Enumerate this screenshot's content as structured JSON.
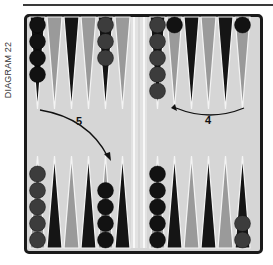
{
  "diagram": {
    "label": "DIAGRAM 22",
    "colors": {
      "board": "#d6d6d6",
      "frame": "#1a1a1a",
      "point_dark": "#151515",
      "point_light": "#9a9a9a",
      "checker_black": "#121212",
      "checker_gray": "#3c3c3c",
      "bar": "#e2e2e2"
    },
    "moves": [
      {
        "id": "move-5",
        "label": "5",
        "description": "Arrow from top-left point area curving down to bottom-left point with 4 black checkers"
      },
      {
        "id": "move-4",
        "label": "4",
        "description": "Arrow curving leftward across top-right quadrant"
      }
    ],
    "top_points": [
      {
        "quadrant": "top-left",
        "index": 1,
        "color": "dark",
        "checkers": 4,
        "checker_color": "black"
      },
      {
        "quadrant": "top-left",
        "index": 2,
        "color": "light",
        "checkers": 0
      },
      {
        "quadrant": "top-left",
        "index": 3,
        "color": "dark",
        "checkers": 0
      },
      {
        "quadrant": "top-left",
        "index": 4,
        "color": "light",
        "checkers": 0
      },
      {
        "quadrant": "top-left",
        "index": 5,
        "color": "dark",
        "checkers": 3,
        "checker_color": "gray"
      },
      {
        "quadrant": "top-left",
        "index": 6,
        "color": "light",
        "checkers": 0
      },
      {
        "quadrant": "top-right",
        "index": 7,
        "color": "dark",
        "checkers": 5,
        "checker_color": "gray"
      },
      {
        "quadrant": "top-right",
        "index": 8,
        "color": "light",
        "checkers": 1,
        "checker_color": "black"
      },
      {
        "quadrant": "top-right",
        "index": 9,
        "color": "dark",
        "checkers": 0
      },
      {
        "quadrant": "top-right",
        "index": 10,
        "color": "light",
        "checkers": 0
      },
      {
        "quadrant": "top-right",
        "index": 11,
        "color": "dark",
        "checkers": 0
      },
      {
        "quadrant": "top-right",
        "index": 12,
        "color": "light",
        "checkers": 1,
        "checker_color": "black"
      }
    ],
    "bottom_points": [
      {
        "quadrant": "bottom-left",
        "index": 1,
        "color": "light",
        "checkers": 5,
        "checker_color": "gray"
      },
      {
        "quadrant": "bottom-left",
        "index": 2,
        "color": "dark",
        "checkers": 0
      },
      {
        "quadrant": "bottom-left",
        "index": 3,
        "color": "light",
        "checkers": 0
      },
      {
        "quadrant": "bottom-left",
        "index": 4,
        "color": "dark",
        "checkers": 0
      },
      {
        "quadrant": "bottom-left",
        "index": 5,
        "color": "light",
        "checkers": 4,
        "checker_color": "black"
      },
      {
        "quadrant": "bottom-left",
        "index": 6,
        "color": "dark",
        "checkers": 0
      },
      {
        "quadrant": "bottom-right",
        "index": 7,
        "color": "light",
        "checkers": 5,
        "checker_color": "black"
      },
      {
        "quadrant": "bottom-right",
        "index": 8,
        "color": "dark",
        "checkers": 0
      },
      {
        "quadrant": "bottom-right",
        "index": 9,
        "color": "light",
        "checkers": 0
      },
      {
        "quadrant": "bottom-right",
        "index": 10,
        "color": "dark",
        "checkers": 0
      },
      {
        "quadrant": "bottom-right",
        "index": 11,
        "color": "light",
        "checkers": 0
      },
      {
        "quadrant": "bottom-right",
        "index": 12,
        "color": "dark",
        "checkers": 2,
        "checker_color": "gray"
      }
    ]
  }
}
